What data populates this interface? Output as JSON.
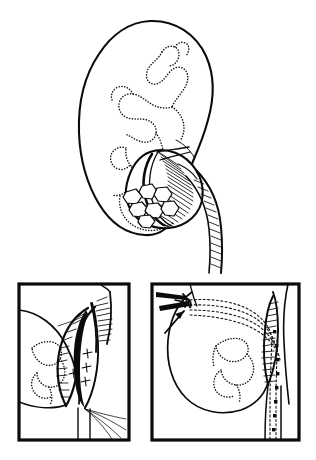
{
  "figure": {
    "background_color": "#ffffff",
    "ink_color": "#0b0b0b",
    "width": 316,
    "height": 460,
    "style": "black-and-white line drawing",
    "caption": ""
  },
  "main_view": {
    "name": "kidney-overview",
    "label": "",
    "organ": "kidney",
    "description": "Kidney in coronal section with dotted calyceal system, renal pelvis containing calculi, and ureter descending",
    "parts": {
      "cortex_label": "",
      "calyces_label": "",
      "renal_pelvis_label": "",
      "ureter_label": "",
      "calculi_label": ""
    },
    "calculi_count": 7
  },
  "panels": [
    {
      "id": "panel-a",
      "label": "",
      "description": "Pyelotomy incision opened with stay sutures placed along the renal pelvis",
      "elements": {
        "incision": "open pyelotomy",
        "sutures": "stay sutures",
        "suture_count": 4,
        "threads": "suture threads drawn inferiorly"
      }
    },
    {
      "id": "panel-b",
      "label": "",
      "description": "Clamp instrument at incision with dotted catheter path traced through pelvis and down the ureter; incision closed with running suture",
      "elements": {
        "instrument": "clamp",
        "arrow": "direction arrow",
        "catheter_path": "dotted guide path",
        "closure": "running suture line"
      }
    }
  ],
  "icons": {
    "arrow": "arrow-icon",
    "clamp": "clamp-icon"
  }
}
